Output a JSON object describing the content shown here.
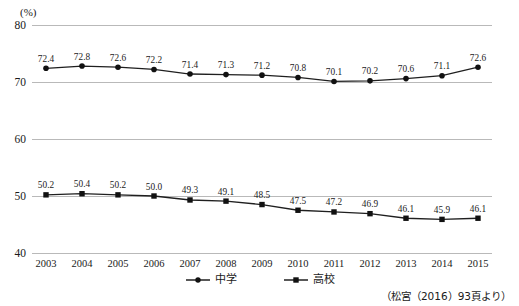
{
  "chart_data": {
    "type": "line",
    "title": "",
    "subtitle": "",
    "xlabel": "",
    "ylabel": "",
    "unit_label": "(%)",
    "categories": [
      "2003",
      "2004",
      "2005",
      "2006",
      "2007",
      "2008",
      "2009",
      "2010",
      "2011",
      "2012",
      "2013",
      "2014",
      "2015"
    ],
    "ylim": [
      40,
      80
    ],
    "yticks": [
      40,
      50,
      60,
      70,
      80
    ],
    "ytick_labels": [
      "40",
      "50",
      "60",
      "70",
      "80"
    ],
    "grid": true,
    "legend_position": "bottom-center",
    "series": [
      {
        "name": "中学",
        "marker": "circle",
        "color": "#111111",
        "values": [
          72.4,
          72.8,
          72.6,
          72.2,
          71.4,
          71.3,
          71.2,
          70.8,
          70.1,
          70.2,
          70.6,
          71.1,
          72.6
        ],
        "labels": [
          "72.4",
          "72.8",
          "72.6",
          "72.2",
          "71.4",
          "71.3",
          "71.2",
          "70.8",
          "70.1",
          "70.2",
          "70.6",
          "71.1",
          "72.6"
        ]
      },
      {
        "name": "高校",
        "marker": "square",
        "color": "#111111",
        "values": [
          50.2,
          50.4,
          50.2,
          50.0,
          49.3,
          49.1,
          48.5,
          47.5,
          47.2,
          46.9,
          46.1,
          45.9,
          46.1
        ],
        "labels": [
          "50.2",
          "50.4",
          "50.2",
          "50.0",
          "49.3",
          "49.1",
          "48.5",
          "47.5",
          "47.2",
          "46.9",
          "46.1",
          "45.9",
          "46.1"
        ]
      }
    ],
    "annotations": [
      {
        "name": "source",
        "text": "（松宮（2016）93頁より）"
      }
    ]
  },
  "legend": {
    "items": [
      {
        "label": "中学",
        "marker": "circle"
      },
      {
        "label": "高校",
        "marker": "square"
      }
    ]
  },
  "source": {
    "text": "（松宮（2016）93頁より）"
  }
}
